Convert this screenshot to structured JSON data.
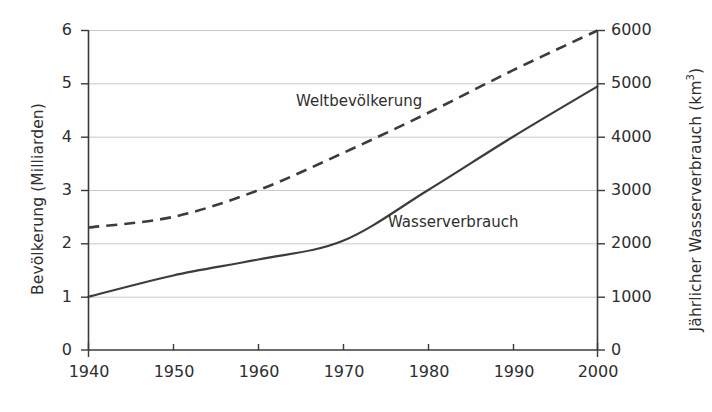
{
  "chart_data": {
    "type": "line",
    "title": "",
    "xlabel": "",
    "ylabel": "Bevölkerung (Milliarden)",
    "ylabel_right": "Jährlicher Wasserverbrauch (km",
    "ylabel_right_sup": "3",
    "ylabel_right_close": ")",
    "x": [
      1940,
      1950,
      1960,
      1970,
      1980,
      1990,
      2000
    ],
    "xlim": [
      1940,
      2000
    ],
    "ylim": [
      0,
      6
    ],
    "ylim_right": [
      0,
      6000
    ],
    "grid": true,
    "legend_position": "inline-annotations",
    "xticks": [
      "1940",
      "1950",
      "1960",
      "1970",
      "1980",
      "1990",
      "2000"
    ],
    "yticks_left": [
      "0",
      "1",
      "2",
      "3",
      "4",
      "5",
      "6"
    ],
    "yticks_right": [
      "0",
      "1000",
      "2000",
      "3000",
      "4000",
      "5000",
      "6000"
    ],
    "series": [
      {
        "name": "Weltbevölkerung",
        "axis": "left",
        "style": "dashed",
        "color": "#3c3c3c",
        "unit": "Milliarden",
        "values": [
          2.3,
          2.5,
          3.0,
          3.7,
          4.45,
          5.25,
          6.0
        ]
      },
      {
        "name": "Wasserverbrauch",
        "axis": "right",
        "style": "solid",
        "color": "#3c3c3c",
        "unit": "km³",
        "values": [
          1000,
          1400,
          1700,
          2050,
          3000,
          4000,
          4950
        ]
      }
    ],
    "annotations": [
      {
        "text": "Weltbevölkerung",
        "x": 1974,
        "y": 4.5
      },
      {
        "text": "Wasserverbrauch",
        "x": 1985,
        "y": 2.2
      }
    ]
  },
  "colors": {
    "axis": "#3a3a3a",
    "grid": "#c9c9c9",
    "line": "#3c3c3c",
    "background": "#fefefe",
    "text": "#2f2f2f"
  }
}
